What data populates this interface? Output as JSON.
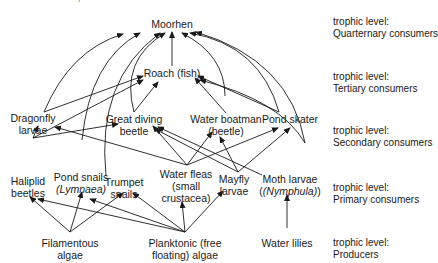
{
  "header": {
    "cut_text": "Food web of a pond"
  },
  "nodes": {
    "moorhen": "Moorhen",
    "roach": "Roach (fish)",
    "dragonfly_1": "Dragonfly",
    "dragonfly_2": "larvae",
    "great_diving_1": "Great diving",
    "great_diving_2": "beetle",
    "water_boatman_1": "Water boatman",
    "water_boatman_2": "(beetle)",
    "pond_skater": "Pond skater",
    "haliplid_1": "Haliplid",
    "haliplid_2": "beetles",
    "pond_snails_1": "Pond snails",
    "pond_snails_2": "(Lymnaea)",
    "trumpet_1": "Trumpet",
    "trumpet_2": "snails",
    "water_fleas_1": "Water fleas",
    "water_fleas_2": "(small",
    "water_fleas_3": "crustacea)",
    "mayfly_1": "Mayfly",
    "mayfly_2": "larvae",
    "moth_1": "Moth larvae",
    "moth_2": "(Nymphula)",
    "filamentous_1": "Filamentous",
    "filamentous_2": "algae",
    "planktonic_1": "Planktonic (free",
    "planktonic_2": "floating) algae",
    "water_lilies": "Water lilies"
  },
  "levels": [
    {
      "label": "trophic level:",
      "name": "Quarternary consumers"
    },
    {
      "label": "trophic level:",
      "name": "Tertiary consumers"
    },
    {
      "label": "trophic level:",
      "name": "Secondary consumers"
    },
    {
      "label": "trophic level:",
      "name": "Primary consumers"
    },
    {
      "label": "trophic level:",
      "name": "Producers"
    }
  ],
  "colors": {
    "ink": "#1a1a1a",
    "background": "#ffffff"
  }
}
